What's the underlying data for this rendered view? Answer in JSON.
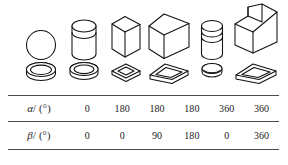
{
  "figure": {
    "name": "shape-parameter-table",
    "columns": [
      {
        "index": 1,
        "solid_icon": "circle-disk-icon",
        "plate_icon": "flat-round-disk-icon",
        "alpha": "0",
        "beta": "0"
      },
      {
        "index": 2,
        "solid_icon": "cylinder-icon",
        "plate_icon": "flat-round-disk-icon",
        "alpha": "180",
        "beta": "0"
      },
      {
        "index": 3,
        "solid_icon": "rectangular-prism-tall-icon",
        "plate_icon": "flat-square-plate-icon",
        "alpha": "180",
        "beta": "90"
      },
      {
        "index": 4,
        "solid_icon": "rectangular-prism-wide-icon",
        "plate_icon": "flat-rectangular-plate-icon",
        "alpha": "180",
        "beta": "180"
      },
      {
        "index": 5,
        "solid_icon": "banded-cylinder-icon",
        "plate_icon": "flat-small-disk-icon",
        "alpha": "360",
        "beta": "0"
      },
      {
        "index": 6,
        "solid_icon": "stepped-l-block-icon",
        "plate_icon": "flat-rectangular-plate-icon",
        "alpha": "360",
        "beta": "360"
      }
    ],
    "rows": [
      {
        "key": "alpha",
        "symbol": "α",
        "separator": "/",
        "unit": "(°)",
        "values": [
          "0",
          "180",
          "180",
          "180",
          "360",
          "360"
        ]
      },
      {
        "key": "beta",
        "symbol": "β",
        "separator": "/",
        "unit": "(°)",
        "values": [
          "0",
          "0",
          "90",
          "180",
          "0",
          "360"
        ]
      }
    ],
    "colors": {
      "background": "#ffffff",
      "stroke": "#111111",
      "rule": "#4b4b4b",
      "text": "#1a1a1a"
    }
  }
}
